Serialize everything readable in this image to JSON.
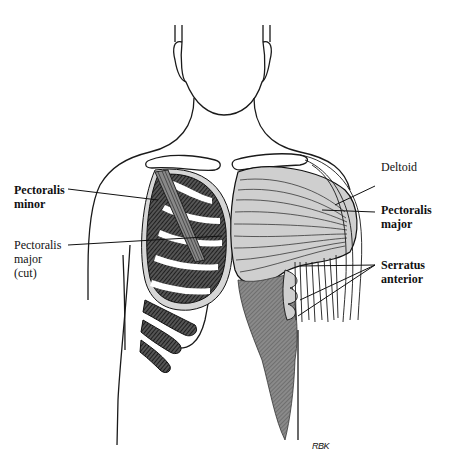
{
  "figure": {
    "signature": "RBK",
    "colors": {
      "line": "#1a1a1a",
      "pec_major_fill": "#cfcfcf",
      "serratus_fill": "#7a7a7a",
      "pec_minor_fill": "#3a3a3a",
      "rib_white": "#ffffff"
    }
  },
  "labels": {
    "left": [
      {
        "line1": "Pectoralis",
        "line2": "minor",
        "line3": "",
        "bold": true
      },
      {
        "line1": "Pectoralis",
        "line2": "major",
        "line3": "(cut)",
        "bold": false
      }
    ],
    "right": [
      {
        "line1": "Deltoid",
        "line2": "",
        "bold": false
      },
      {
        "line1": "Pectoralis",
        "line2": "major",
        "bold": true
      },
      {
        "line1": "Serratus",
        "line2": "anterior",
        "bold": true
      }
    ]
  }
}
